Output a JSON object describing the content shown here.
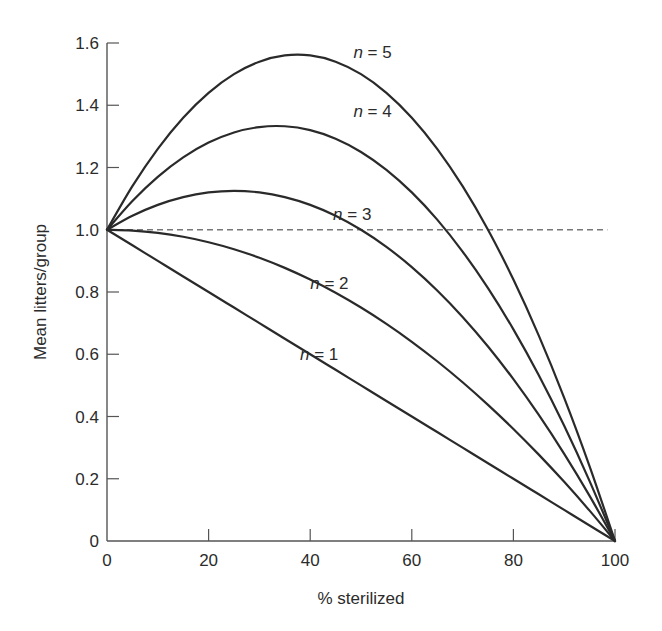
{
  "chart_data": {
    "type": "line",
    "title": "",
    "xlabel": "% sterilized",
    "ylabel": "Mean litters/group",
    "xlim": [
      0,
      100
    ],
    "ylim": [
      0,
      1.6
    ],
    "grid": false,
    "legend": "inline curve labels",
    "x_ticks": [
      0,
      20,
      40,
      60,
      80,
      100
    ],
    "x_tick_labels": [
      "0",
      "20",
      "40",
      "60",
      "80",
      "100"
    ],
    "y_ticks": [
      0,
      0.2,
      0.4,
      0.6,
      0.8,
      1.0,
      1.2,
      1.4,
      1.6
    ],
    "y_tick_labels": [
      "0",
      "0.2",
      "0.4",
      "0.6",
      "0.8",
      "1.0",
      "1.2",
      "1.4",
      "1.6"
    ],
    "reference_line": {
      "y": 1.0,
      "style": "dashed",
      "x_start": 0,
      "x_end": 98.5
    },
    "x": [
      0,
      5,
      10,
      15,
      20,
      25,
      30,
      35,
      40,
      45,
      50,
      55,
      60,
      65,
      70,
      75,
      80,
      85,
      90,
      95,
      100
    ],
    "series": [
      {
        "name": "n = 1",
        "n_value": "1",
        "label_x": 38,
        "label_y": 0.6,
        "values": [
          1.0,
          0.95,
          0.9,
          0.85,
          0.8,
          0.75,
          0.7,
          0.65,
          0.6,
          0.55,
          0.5,
          0.45,
          0.4,
          0.35,
          0.3,
          0.25,
          0.2,
          0.15,
          0.1,
          0.05,
          0.0
        ]
      },
      {
        "name": "n = 2",
        "n_value": "2",
        "label_x": 40,
        "label_y": 0.83,
        "values": [
          1.0,
          0.9975,
          0.99,
          0.9775,
          0.96,
          0.9375,
          0.91,
          0.8775,
          0.84,
          0.7975,
          0.75,
          0.6975,
          0.64,
          0.5775,
          0.51,
          0.4375,
          0.36,
          0.2775,
          0.19,
          0.0975,
          0.0
        ]
      },
      {
        "name": "n = 3",
        "n_value": "3",
        "label_x": 44.5,
        "label_y": 1.05,
        "values": [
          1.0,
          1.045,
          1.08,
          1.105,
          1.12,
          1.125,
          1.12,
          1.105,
          1.08,
          1.045,
          1.0,
          0.945,
          0.88,
          0.805,
          0.72,
          0.625,
          0.52,
          0.405,
          0.28,
          0.145,
          0.0
        ]
      },
      {
        "name": "n = 4",
        "n_value": "4",
        "label_x": 48.5,
        "label_y": 1.38,
        "values": [
          1.0,
          1.0925,
          1.17,
          1.2325,
          1.28,
          1.3125,
          1.33,
          1.3325,
          1.32,
          1.2925,
          1.25,
          1.1925,
          1.12,
          1.0325,
          0.93,
          0.8125,
          0.68,
          0.5325,
          0.37,
          0.1925,
          0.0
        ]
      },
      {
        "name": "n = 5",
        "n_value": "5",
        "label_x": 48.5,
        "label_y": 1.57,
        "values": [
          1.0,
          1.14,
          1.26,
          1.36,
          1.44,
          1.5,
          1.54,
          1.56,
          1.56,
          1.54,
          1.5,
          1.44,
          1.36,
          1.26,
          1.14,
          1.0,
          0.84,
          0.66,
          0.46,
          0.24,
          0.0
        ]
      }
    ],
    "formula_note": "curves follow (1 - p)(1 + (n - 1)p)"
  },
  "labels": {
    "n_prefix": "n",
    "equals": " = "
  }
}
